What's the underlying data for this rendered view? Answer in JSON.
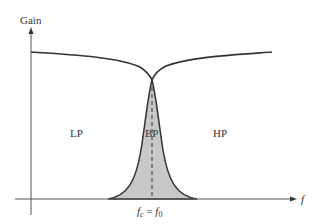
{
  "figure": {
    "y_axis_label": "Gain",
    "x_axis_label": "f",
    "regions": {
      "lp": "LP",
      "bp": "BP",
      "hp": "HP"
    },
    "center_freq_label": {
      "lhs_base": "f",
      "lhs_sub": "c",
      "equals": " = ",
      "rhs_base": "f",
      "rhs_sub": "0"
    },
    "colors": {
      "curve": "#333333",
      "bandpass_fill": "#c8c8c8",
      "axis": "#333333",
      "background": "#ffffff"
    }
  }
}
